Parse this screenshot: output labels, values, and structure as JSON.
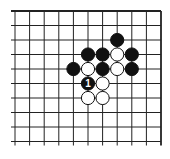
{
  "diagram": {
    "type": "go-board-fragment",
    "grid": {
      "columns": 11,
      "rows": 10,
      "origin_x": 15,
      "origin_y": 11,
      "spacing_x": 14.6,
      "spacing_y": 14.5,
      "edges": {
        "top": true,
        "right": true,
        "left": false,
        "bottom": false
      }
    },
    "stones": [
      {
        "color": "black",
        "col": 7,
        "row": 2
      },
      {
        "color": "black",
        "col": 5,
        "row": 3
      },
      {
        "color": "black",
        "col": 6,
        "row": 3
      },
      {
        "color": "white",
        "col": 7,
        "row": 3
      },
      {
        "color": "black",
        "col": 8,
        "row": 3
      },
      {
        "color": "black",
        "col": 4,
        "row": 4
      },
      {
        "color": "white",
        "col": 5,
        "row": 4
      },
      {
        "color": "black",
        "col": 6,
        "row": 4
      },
      {
        "color": "white",
        "col": 7,
        "row": 4
      },
      {
        "color": "black",
        "col": 8,
        "row": 4
      },
      {
        "color": "black",
        "col": 5,
        "row": 5,
        "label": "1"
      },
      {
        "color": "white",
        "col": 6,
        "row": 5
      },
      {
        "color": "white",
        "col": 5,
        "row": 6
      },
      {
        "color": "white",
        "col": 6,
        "row": 6
      }
    ],
    "colors": {
      "line": "#222222",
      "black_stone": "#111111",
      "white_stone": "#ffffff",
      "stone_outline": "#111111"
    }
  }
}
